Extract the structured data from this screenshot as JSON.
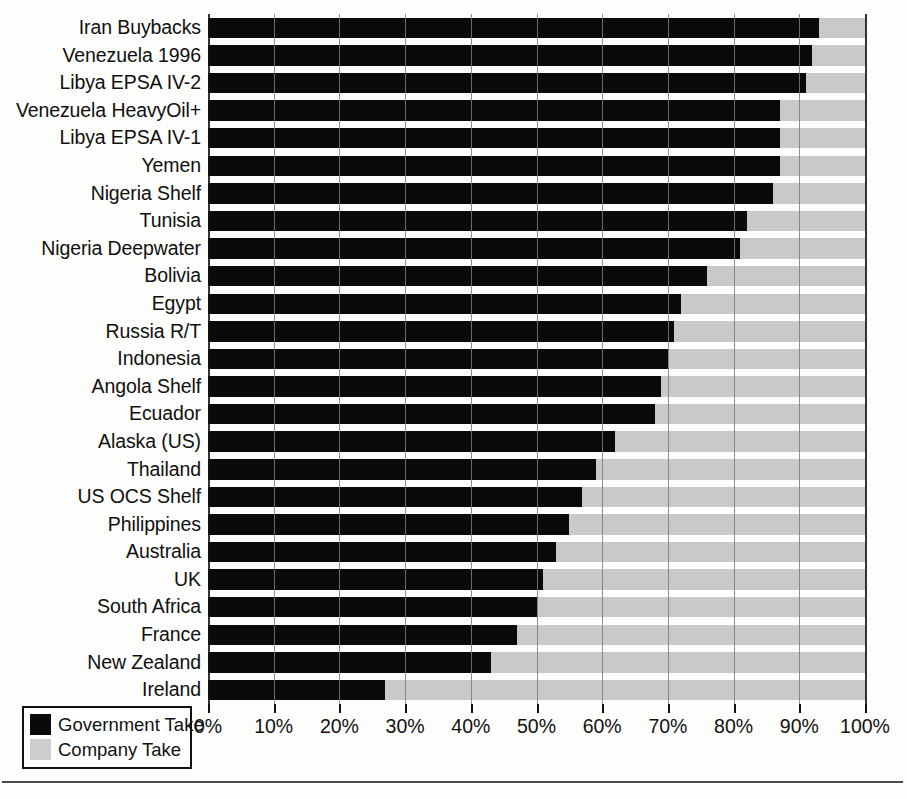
{
  "chart_data": {
    "type": "bar",
    "orientation": "horizontal",
    "stacked": true,
    "title": "",
    "xlabel": "",
    "ylabel": "",
    "xlim": [
      0,
      100
    ],
    "xticks": [
      "0%",
      "10%",
      "20%",
      "30%",
      "40%",
      "50%",
      "60%",
      "70%",
      "80%",
      "90%",
      "100%"
    ],
    "xtick_values": [
      0,
      10,
      20,
      30,
      40,
      50,
      60,
      70,
      80,
      90,
      100
    ],
    "grid": "vertical",
    "legend_position": "bottom-left",
    "categories": [
      "Iran Buybacks",
      "Venezuela 1996",
      "Libya EPSA IV-2",
      "Venezuela HeavyOil+",
      "Libya EPSA IV-1",
      "Yemen",
      "Nigeria Shelf",
      "Tunisia",
      "Nigeria Deepwater",
      "Bolivia",
      "Egypt",
      "Russia R/T",
      "Indonesia",
      "Angola Shelf",
      "Ecuador",
      "Alaska (US)",
      "Thailand",
      "US OCS Shelf",
      "Philippines",
      "Australia",
      "UK",
      "South Africa",
      "France",
      "New Zealand",
      "Ireland"
    ],
    "series": [
      {
        "name": "Government Take",
        "color": "#0a0a0a",
        "values": [
          93,
          92,
          91,
          87,
          87,
          87,
          86,
          82,
          81,
          76,
          72,
          71,
          70,
          69,
          68,
          62,
          59,
          57,
          55,
          53,
          51,
          50,
          47,
          43,
          27
        ]
      },
      {
        "name": "Company Take",
        "color": "#cecece",
        "values": [
          7,
          8,
          9,
          13,
          13,
          13,
          14,
          18,
          19,
          24,
          28,
          29,
          30,
          31,
          32,
          38,
          41,
          43,
          45,
          47,
          49,
          50,
          53,
          57,
          73
        ]
      }
    ]
  },
  "legend": {
    "items": [
      {
        "label": "Government Take",
        "swatch": "gov"
      },
      {
        "label": "Company Take",
        "swatch": "co"
      }
    ]
  }
}
